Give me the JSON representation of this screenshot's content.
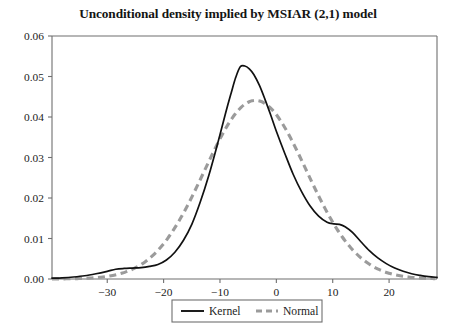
{
  "chart_data": {
    "type": "line",
    "title": "Unconditional density implied by MSIAR (2,1) model",
    "xlabel": "",
    "ylabel": "",
    "xlim": [
      -39.8,
      28.5
    ],
    "ylim": [
      0.0,
      0.06
    ],
    "grid": false,
    "legend_position": "bottom-center",
    "xticks": [
      -30,
      -20,
      -10,
      0,
      10,
      20
    ],
    "xtick_labels": [
      "-30",
      "-20",
      "-10",
      "0",
      "10",
      "20"
    ],
    "yticks": [
      0.0,
      0.01,
      0.02,
      0.03,
      0.04,
      0.05,
      0.06
    ],
    "ytick_labels": [
      "0.00",
      "0.01",
      "0.02",
      "0.03",
      "0.04",
      "0.05",
      "0.06"
    ],
    "series": [
      {
        "name": "Kernel",
        "style": "solid",
        "color": "#111111",
        "x": [
          -39.8,
          -38,
          -36,
          -34,
          -32,
          -30,
          -28.5,
          -27,
          -25.5,
          -24,
          -22.5,
          -21,
          -19.5,
          -18,
          -16.5,
          -15,
          -13.5,
          -12,
          -10.5,
          -9,
          -8,
          -7.2,
          -6.4,
          -5.6,
          -4.8,
          -4,
          -3,
          -2,
          -1,
          0,
          1.5,
          3,
          4.5,
          6,
          7.5,
          9,
          10.2,
          11.2,
          12.2,
          13.5,
          15,
          16.5,
          18,
          19.5,
          21,
          22.5,
          24,
          25.5,
          27,
          28.5
        ],
        "y": [
          0.0002,
          0.0003,
          0.0005,
          0.0008,
          0.0013,
          0.0019,
          0.0024,
          0.0026,
          0.0027,
          0.0028,
          0.0031,
          0.0036,
          0.0047,
          0.0066,
          0.0095,
          0.0135,
          0.019,
          0.0255,
          0.033,
          0.041,
          0.046,
          0.0498,
          0.0524,
          0.0526,
          0.0519,
          0.0505,
          0.0478,
          0.0443,
          0.0405,
          0.0365,
          0.031,
          0.0258,
          0.0215,
          0.018,
          0.0155,
          0.014,
          0.0136,
          0.0135,
          0.0129,
          0.0115,
          0.0092,
          0.007,
          0.0052,
          0.0038,
          0.0027,
          0.0019,
          0.0013,
          0.0009,
          0.0006,
          0.0004
        ]
      },
      {
        "name": "Normal",
        "style": "dashed",
        "color": "#9b9b9b",
        "mean": -3.7,
        "sd": 9.05,
        "peak": 0.0441,
        "x": [
          -39.8,
          -38,
          -36,
          -34,
          -32,
          -30,
          -28,
          -26,
          -24,
          -22,
          -20,
          -18,
          -16,
          -14,
          -12,
          -10,
          -8,
          -6,
          -5,
          -4.5,
          -3.7,
          -3,
          -2,
          -1,
          0,
          1.5,
          3,
          4.5,
          6,
          7.5,
          9,
          10.5,
          12,
          13.5,
          15,
          16.5,
          18,
          19.5,
          21,
          22.5,
          24,
          25.5,
          27,
          28.5
        ],
        "y": [
          9e-05,
          0.00015,
          0.00029,
          0.00053,
          0.00094,
          0.00157,
          0.00253,
          0.00389,
          0.0057,
          0.00797,
          0.01063,
          0.01353,
          0.01643,
          0.01907,
          0.0212,
          0.02259,
          0.02311,
          0.02272,
          0.0221,
          0.0217,
          0.022,
          0.0215,
          0.0209,
          0.0201,
          0.0191,
          0.0174,
          0.01553,
          0.0136,
          0.0116,
          0.00973,
          0.008,
          0.00645,
          0.0051,
          0.00395,
          0.003,
          0.00222,
          0.00161,
          0.00114,
          0.00079,
          0.00053,
          0.00035,
          0.00022,
          0.00014,
          9e-05
        ]
      }
    ]
  },
  "legend": {
    "entries": [
      {
        "label": "Kernel",
        "style": "solid",
        "color": "#111111"
      },
      {
        "label": "Normal",
        "style": "dashed",
        "color": "#9b9b9b"
      }
    ]
  },
  "colors": {
    "kernel": "#111111",
    "normal": "#9b9b9b",
    "axis": "#6f6f6f",
    "text": "#1a1a1a",
    "background": "#ffffff"
  }
}
